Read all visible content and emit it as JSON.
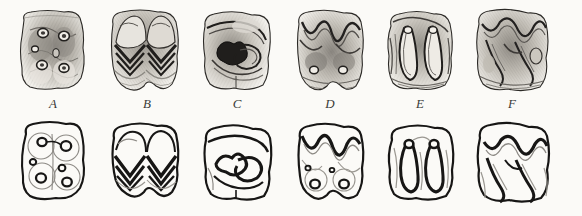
{
  "figure": {
    "background_color": "#fbfaf7",
    "ink_color": "#1a1a1a",
    "shade_color": "#6f6c66",
    "rows": [
      {
        "name": "photographic-row",
        "caption": ""
      },
      {
        "name": "diagram-row",
        "caption": ""
      }
    ],
    "labels": [
      "A",
      "B",
      "C",
      "D",
      "E",
      "F"
    ],
    "specimens": [
      {
        "label": "A",
        "pattern_name": "bunodont",
        "description": "Low rounded cusps with five enamel lakes",
        "lake_count": 5,
        "x_center": 53
      },
      {
        "label": "B",
        "pattern_name": "selenodont",
        "description": "Paired crescentic chevron lophs",
        "chevron_count": 2,
        "x_center": 147
      },
      {
        "label": "C",
        "pattern_name": "sinuous-loph",
        "description": "S-shaped enamel loop with central fossette",
        "loop_count": 1,
        "x_center": 237
      },
      {
        "label": "D",
        "pattern_name": "dilambdodont",
        "description": "W-shaped ectoloph over two rounded lakes",
        "lake_count": 2,
        "x_center": 330
      },
      {
        "label": "E",
        "pattern_name": "bilophodont",
        "description": "Two elongate loops each capped by a round pit",
        "loop_count": 2,
        "x_center": 420
      },
      {
        "label": "F",
        "pattern_name": "zigzag-loph",
        "description": "Zigzag ectoloph with two oblique lophs",
        "loph_count": 2,
        "x_center": 512
      }
    ]
  }
}
